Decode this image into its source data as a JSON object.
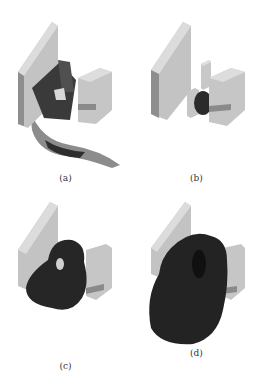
{
  "figure": {
    "panels": [
      {
        "id": "a",
        "caption": "(a)"
      },
      {
        "id": "b",
        "caption": "(b)"
      },
      {
        "id": "c",
        "caption": "(c)"
      },
      {
        "id": "d",
        "caption": "(d)"
      }
    ]
  },
  "colors": {
    "block_light": "#c8c8c8",
    "block_side": "#9a9a9a",
    "block_top": "#dedede",
    "dark_shape": "#2a2a2a",
    "background": "#ffffff"
  }
}
